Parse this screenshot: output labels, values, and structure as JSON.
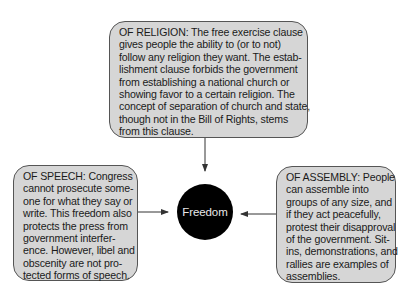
{
  "diagram": {
    "center": {
      "label": "Freedom",
      "fill": "#000000",
      "text_color": "#e8e8e8"
    },
    "boxes": {
      "religion": {
        "title": "OF RELIGION",
        "lines": [
          "OF RELIGION: The free exercise clause",
          "gives people the ability to (or to not)",
          "follow any religion they want. The estab-",
          "lishment clause forbids the government",
          "from establishing a national church or",
          "showing favor to a certain religion. The",
          "concept of separation of church and state,",
          "though not in the Bill of Rights, stems",
          "from this clause."
        ]
      },
      "speech": {
        "title": "OF SPEECH",
        "lines": [
          "OF SPEECH: Congress",
          "cannot prosecute some-",
          "one for what they say or",
          "write. This freedom also",
          "protects the press from",
          "government interfer-",
          "ence. However, libel and",
          "obscenity are not pro-",
          "tected forms of speech."
        ]
      },
      "assembly": {
        "title": "OF ASSEMBLY",
        "lines": [
          "OF ASSEMBLY: People",
          "can assemble into",
          "groups of any size, and",
          "if they act peacefully,",
          "protest their disapproval",
          "of the government. Sit-",
          "ins, demonstrations, and",
          "rallies are examples of",
          "assemblies."
        ]
      }
    },
    "colors": {
      "box_fill": "#d6d6d6",
      "box_border": "#555555",
      "arrow": "#333333"
    },
    "arrows": [
      {
        "from": "religion",
        "to": "center",
        "direction": "down"
      },
      {
        "from": "speech",
        "to": "center",
        "direction": "right"
      },
      {
        "from": "assembly",
        "to": "center",
        "direction": "left"
      }
    ]
  }
}
